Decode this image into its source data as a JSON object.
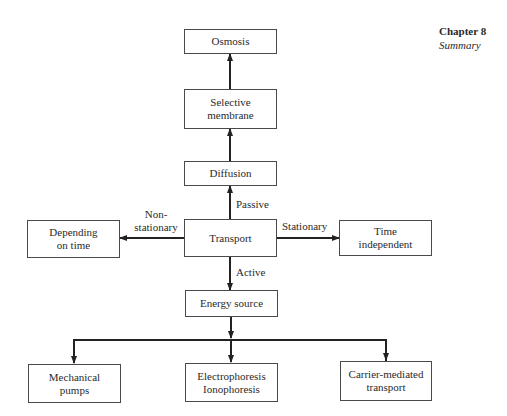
{
  "header": {
    "chapter": "Chapter 8",
    "subtitle": "Summary"
  },
  "nodes": {
    "osmosis": "Osmosis",
    "selective_membrane": "Selective\nmembrane",
    "diffusion": "Diffusion",
    "transport": "Transport",
    "depending_on_time": "Depending\non time",
    "time_independent": "Time\nindependent",
    "energy_source": "Energy source",
    "mechanical_pumps": "Mechanical\npumps",
    "electrophoresis": "Electrophoresis\nIonophoresis",
    "carrier_mediated": "Carrier-mediated\ntransport"
  },
  "edge_labels": {
    "passive": "Passive",
    "active": "Active",
    "non_stationary": "Non-\nstationary",
    "stationary": "Stationary"
  }
}
